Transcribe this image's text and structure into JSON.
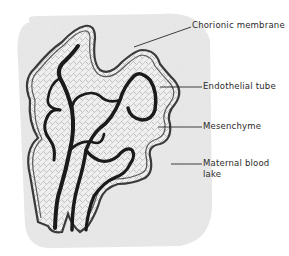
{
  "figure": {
    "labels": [
      {
        "id": "chorionic-membrane",
        "text": "Chorionic membrane",
        "x": 192,
        "y": 20
      },
      {
        "id": "endothelial-tube",
        "text": "Endothelial tube",
        "x": 203,
        "y": 81
      },
      {
        "id": "mesenchyme",
        "text": "Mesenchyme",
        "x": 203,
        "y": 121
      },
      {
        "id": "maternal-blood-lake-line1",
        "text": "Maternal blood",
        "x": 203,
        "y": 160
      },
      {
        "id": "maternal-blood-lake-line2",
        "text": "lake",
        "x": 203,
        "y": 171
      }
    ],
    "colors": {
      "background": "#ffffff",
      "blood_lake": "#e9e9e9",
      "membrane": "#3a3a3a",
      "vessel": "#1a1a1a",
      "text": "#2a2a2a"
    }
  }
}
